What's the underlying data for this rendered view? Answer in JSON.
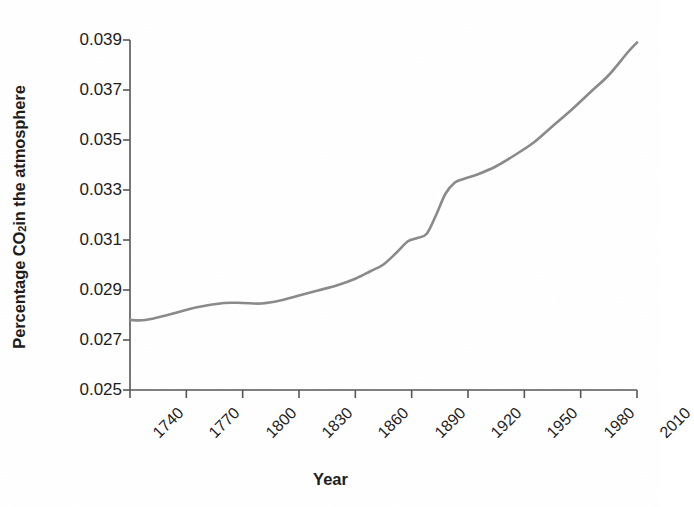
{
  "chart_data": {
    "type": "line",
    "title": "",
    "xlabel": "Year",
    "ylabel_parts": {
      "pre": "Percentage CO",
      "sub": "2",
      "post": " in the atmosphere"
    },
    "ylabel": "Percentage CO2 in the atmosphere",
    "xlim": [
      1740,
      2010
    ],
    "ylim": [
      0.025,
      0.039
    ],
    "xticks": [
      "1740",
      "1770",
      "1800",
      "1830",
      "1860",
      "1890",
      "1920",
      "1950",
      "1980",
      "2010"
    ],
    "xtick_values": [
      1740,
      1770,
      1800,
      1830,
      1860,
      1890,
      1920,
      1950,
      1980,
      2010
    ],
    "yticks": [
      "0.025",
      "0.027",
      "0.029",
      "0.031",
      "0.033",
      "0.035",
      "0.037",
      "0.039"
    ],
    "ytick_values": [
      0.025,
      0.027,
      0.029,
      0.031,
      0.033,
      0.035,
      0.037,
      0.039
    ],
    "grid": false,
    "legend": false,
    "line_color": "#8a8a8a",
    "axis_color": "#555555",
    "text_color": "#1b1b1b",
    "series": [
      {
        "name": "Percentage CO2 in the atmosphere",
        "x": [
          1740,
          1748,
          1760,
          1775,
          1790,
          1800,
          1810,
          1820,
          1830,
          1840,
          1850,
          1860,
          1868,
          1875,
          1882,
          1888,
          1893,
          1898,
          1903,
          1908,
          1913,
          1918,
          1925,
          1935,
          1945,
          1955,
          1965,
          1975,
          1985,
          1995,
          2005,
          2010
        ],
        "y": [
          0.0278,
          0.0278,
          0.028,
          0.0283,
          0.02848,
          0.02848,
          0.02846,
          0.02858,
          0.02878,
          0.02898,
          0.02918,
          0.02945,
          0.02975,
          0.03002,
          0.0305,
          0.03095,
          0.03108,
          0.03125,
          0.032,
          0.03285,
          0.0333,
          0.03345,
          0.03362,
          0.03395,
          0.0344,
          0.0349,
          0.03555,
          0.0362,
          0.0369,
          0.0376,
          0.0385,
          0.0389
        ]
      }
    ]
  },
  "axis_geometry": {
    "plot_left": 130,
    "plot_right": 637,
    "plot_top": 40,
    "plot_bottom": 390
  }
}
